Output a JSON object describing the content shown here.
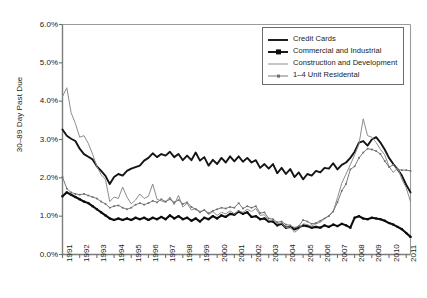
{
  "chart_data": {
    "type": "line",
    "title": "",
    "xlabel": "",
    "ylabel": "30–89 Day Past Due",
    "ylim": [
      0,
      6
    ],
    "ytick_labels": [
      "0.0%",
      "1.0%",
      "2.0%",
      "3.0%",
      "4.0%",
      "5.0%",
      "6.0%"
    ],
    "ytick_values": [
      0,
      1,
      2,
      3,
      4,
      5,
      6
    ],
    "xlim": [
      1991,
      2011.25
    ],
    "xtick_labels": [
      "1991",
      "1992",
      "1993",
      "1994",
      "1995",
      "1996",
      "1997",
      "1998",
      "1999",
      "2000",
      "2001",
      "2002",
      "2003",
      "2004",
      "2005",
      "2006",
      "2007",
      "2008",
      "2009",
      "2010",
      "2011"
    ],
    "xtick_values": [
      1991,
      1992,
      1993,
      1994,
      1995,
      1996,
      1997,
      1998,
      1999,
      2000,
      2001,
      2002,
      2003,
      2004,
      2005,
      2006,
      2007,
      2008,
      2009,
      2010,
      2011
    ],
    "grid": false,
    "legend_position": "upper-right",
    "x": [
      1991.0,
      1991.25,
      1991.5,
      1991.75,
      1992.0,
      1992.25,
      1992.5,
      1992.75,
      1993.0,
      1993.25,
      1993.5,
      1993.75,
      1994.0,
      1994.25,
      1994.5,
      1994.75,
      1995.0,
      1995.25,
      1995.5,
      1995.75,
      1996.0,
      1996.25,
      1996.5,
      1996.75,
      1997.0,
      1997.25,
      1997.5,
      1997.75,
      1998.0,
      1998.25,
      1998.5,
      1998.75,
      1999.0,
      1999.25,
      1999.5,
      1999.75,
      2000.0,
      2000.25,
      2000.5,
      2000.75,
      2001.0,
      2001.25,
      2001.5,
      2001.75,
      2002.0,
      2002.25,
      2002.5,
      2002.75,
      2003.0,
      2003.25,
      2003.5,
      2003.75,
      2004.0,
      2004.25,
      2004.5,
      2004.75,
      2005.0,
      2005.25,
      2005.5,
      2005.75,
      2006.0,
      2006.25,
      2006.5,
      2006.75,
      2007.0,
      2007.25,
      2007.5,
      2007.75,
      2008.0,
      2008.25,
      2008.5,
      2008.75,
      2009.0,
      2009.25,
      2009.5,
      2009.75,
      2010.0,
      2010.25,
      2010.5,
      2010.75,
      2011.0,
      2011.25
    ],
    "series": [
      {
        "name": "Credit Cards",
        "color": "#141414",
        "style": "thick-solid-black",
        "marker": "none",
        "values": [
          3.26,
          3.1,
          3.02,
          2.96,
          2.76,
          2.62,
          2.55,
          2.48,
          2.3,
          2.18,
          2.05,
          1.84,
          2.02,
          2.1,
          2.06,
          2.18,
          2.24,
          2.28,
          2.32,
          2.45,
          2.52,
          2.64,
          2.54,
          2.62,
          2.58,
          2.68,
          2.54,
          2.62,
          2.46,
          2.58,
          2.46,
          2.66,
          2.45,
          2.54,
          2.32,
          2.47,
          2.36,
          2.52,
          2.4,
          2.56,
          2.43,
          2.56,
          2.42,
          2.52,
          2.4,
          2.46,
          2.26,
          2.36,
          2.24,
          2.36,
          2.12,
          2.26,
          2.1,
          2.23,
          2.02,
          2.14,
          1.96,
          2.1,
          2.06,
          2.18,
          2.14,
          2.26,
          2.24,
          2.38,
          2.22,
          2.34,
          2.4,
          2.52,
          2.68,
          2.92,
          2.96,
          2.84,
          3.0,
          3.06,
          2.92,
          2.74,
          2.52,
          2.36,
          2.22,
          2.06,
          1.82,
          1.62
        ]
      },
      {
        "name": "Commercial and Industrial",
        "color": "#0d0d0d",
        "style": "thick-solid-black-marker",
        "marker": "square",
        "values": [
          1.52,
          1.62,
          1.56,
          1.5,
          1.44,
          1.38,
          1.34,
          1.26,
          1.18,
          1.1,
          1.02,
          0.94,
          0.9,
          0.94,
          0.9,
          0.94,
          0.9,
          0.96,
          0.92,
          0.96,
          0.9,
          0.96,
          0.92,
          0.98,
          0.92,
          1.02,
          0.94,
          1.0,
          0.92,
          0.96,
          0.88,
          0.94,
          0.86,
          0.96,
          0.92,
          1.0,
          0.94,
          1.02,
          0.98,
          1.06,
          1.04,
          1.12,
          1.06,
          1.1,
          0.98,
          1.0,
          0.92,
          0.94,
          0.86,
          0.86,
          0.76,
          0.8,
          0.7,
          0.72,
          0.66,
          0.7,
          0.76,
          0.74,
          0.7,
          0.72,
          0.7,
          0.76,
          0.72,
          0.78,
          0.74,
          0.8,
          0.76,
          0.7,
          0.96,
          1.0,
          0.94,
          0.92,
          0.96,
          0.94,
          0.92,
          0.88,
          0.82,
          0.78,
          0.72,
          0.66,
          0.56,
          0.46
        ]
      },
      {
        "name": "Construction and Development",
        "color": "#8c8c8c",
        "style": "thin-gray",
        "marker": "none",
        "values": [
          4.12,
          4.35,
          3.7,
          3.42,
          3.06,
          3.1,
          2.9,
          2.62,
          2.3,
          2.08,
          1.96,
          1.38,
          1.5,
          1.46,
          1.76,
          1.5,
          1.32,
          1.42,
          1.58,
          1.46,
          1.52,
          1.84,
          1.44,
          1.4,
          1.36,
          1.5,
          1.3,
          1.54,
          1.24,
          1.34,
          1.16,
          1.2,
          1.12,
          1.16,
          1.04,
          1.12,
          1.02,
          1.1,
          1.06,
          1.14,
          1.06,
          1.14,
          1.1,
          1.18,
          1.12,
          1.2,
          1.02,
          1.04,
          0.88,
          0.9,
          0.8,
          0.82,
          0.7,
          0.72,
          0.58,
          0.66,
          0.8,
          0.78,
          0.74,
          0.8,
          0.84,
          0.94,
          1.02,
          1.12,
          1.48,
          1.86,
          2.1,
          2.34,
          2.6,
          2.88,
          3.54,
          3.1,
          3.06,
          2.92,
          2.74,
          2.6,
          2.3,
          2.14,
          2.26,
          1.96,
          1.74,
          1.38
        ]
      },
      {
        "name": "1–4 Unit Residental",
        "color": "#7a7a7a",
        "style": "gray-marker",
        "marker": "dot",
        "values": [
          2.02,
          1.72,
          1.62,
          1.58,
          1.56,
          1.58,
          1.54,
          1.5,
          1.46,
          1.38,
          1.32,
          1.22,
          1.26,
          1.28,
          1.22,
          1.18,
          1.22,
          1.3,
          1.34,
          1.3,
          1.34,
          1.4,
          1.36,
          1.44,
          1.38,
          1.44,
          1.36,
          1.42,
          1.32,
          1.36,
          1.24,
          1.18,
          1.1,
          1.16,
          1.08,
          1.14,
          1.18,
          1.22,
          1.2,
          1.24,
          1.22,
          1.34,
          1.2,
          1.26,
          1.22,
          1.26,
          1.08,
          1.1,
          0.94,
          0.92,
          0.84,
          0.86,
          0.78,
          0.76,
          0.7,
          0.74,
          0.9,
          0.86,
          0.8,
          0.82,
          0.88,
          0.94,
          1.0,
          1.12,
          1.36,
          1.66,
          1.84,
          2.22,
          2.3,
          2.52,
          2.66,
          2.76,
          2.74,
          2.7,
          2.62,
          2.44,
          2.28,
          2.34,
          2.22,
          2.2,
          2.2,
          2.18
        ]
      }
    ]
  },
  "legend": {
    "items": [
      {
        "label": "Credit Cards"
      },
      {
        "label": "Commercial and Industrial"
      },
      {
        "label": "Construction and Development"
      },
      {
        "label": "1–4 Unit Residental"
      }
    ]
  }
}
